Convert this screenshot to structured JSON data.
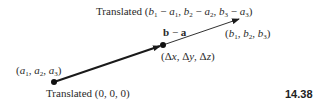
{
  "diagram": {
    "figure_number": "14.38",
    "labels": {
      "top_translated_prefix": "Translated",
      "top_translated_expr": "(b1 − a1, b2 − a2, b3 − a3)",
      "vector_label": "b − a",
      "endpoint_b": "(b1, b2, b3)",
      "midpoint_delta": "(Δx, Δy, Δz)",
      "start_point_a": "(a1, a2, a3)",
      "bottom_translated": "Translated (0, 0, 0)"
    },
    "points": {
      "origin_dot": {
        "x": 54,
        "y": 82
      },
      "mid_dot": {
        "x": 163,
        "y": 45
      }
    },
    "arrows": [
      {
        "name": "thick-arrow",
        "from": [
          54,
          82
        ],
        "to": [
          160,
          46
        ],
        "weight": "thick"
      },
      {
        "name": "thin-arrow",
        "from": [
          163,
          45
        ],
        "to": [
          239,
          19
        ],
        "weight": "thin"
      }
    ],
    "colors": {
      "ink": "#1a1a1a",
      "background": "#ffffff"
    }
  }
}
